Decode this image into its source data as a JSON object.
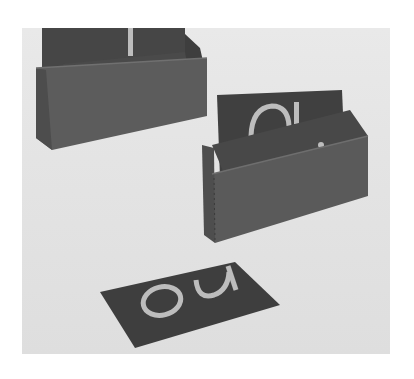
{
  "image": {
    "description": "Grayscale photo of two wooden boxes holding sandpaper letter cards, with one card lying flat in front",
    "colors": {
      "background": "#e4e4e4",
      "box": "#5a5a5a",
      "box_dark": "#4a4a4a",
      "card": "#3e3e3e",
      "letters": "#bdbdbd"
    }
  },
  "objects": {
    "back_box": {
      "label": "back-left box with cards",
      "front_card_letters": "ai"
    },
    "front_box": {
      "label": "front-right box with cards",
      "back_card_letters": "au",
      "front_card_letters": "ai"
    },
    "loose_card": {
      "label": "card lying flat",
      "letters": "ou"
    }
  }
}
